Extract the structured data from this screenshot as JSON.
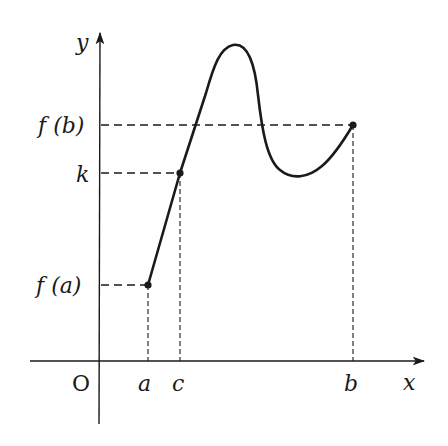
{
  "diagram": {
    "axes": {
      "x_label": "x",
      "y_label": "y",
      "origin_label": "O"
    },
    "x_ticks": [
      {
        "id": "a",
        "label": "a"
      },
      {
        "id": "c",
        "label": "c"
      },
      {
        "id": "b",
        "label": "b"
      }
    ],
    "y_ticks": [
      {
        "id": "fb",
        "label": "f (b)"
      },
      {
        "id": "k",
        "label": "k"
      },
      {
        "id": "fa",
        "label": "f (a)"
      }
    ],
    "points": [
      {
        "name": "A",
        "x_label": "a",
        "y_label": "f (a)"
      },
      {
        "name": "C",
        "x_label": "c",
        "y_label": "k"
      },
      {
        "name": "B",
        "x_label": "b",
        "y_label": "f (b)"
      }
    ],
    "colors": {
      "stroke": "#1a1a1a",
      "background": "#ffffff"
    }
  }
}
